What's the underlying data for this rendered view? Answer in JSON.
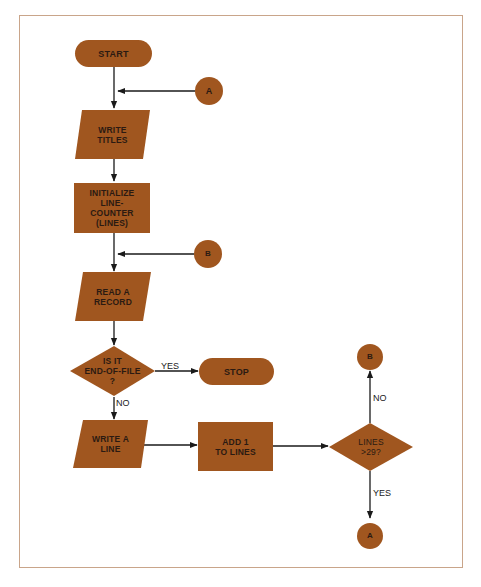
{
  "colors": {
    "shape_fill": "#a0561f",
    "line": "#1a1a1a",
    "frame_border": "#c9a58a",
    "text": "#2b1a12"
  },
  "nodes": {
    "start": {
      "label": "START",
      "shape": "terminal"
    },
    "connector_a_top": {
      "label": "A",
      "shape": "connector"
    },
    "write_titles": {
      "label": "WRITE\nTITLES",
      "shape": "input-output"
    },
    "initialize": {
      "label": "INITIALIZE\nLINE-\nCOUNTER\n(LINES)",
      "shape": "process"
    },
    "connector_b_mid": {
      "label": "B",
      "shape": "connector"
    },
    "read_record": {
      "label": "READ A\nRECORD",
      "shape": "input-output"
    },
    "eof_decision": {
      "label": "IS IT\nEND-OF-FILE\n?",
      "shape": "decision"
    },
    "stop": {
      "label": "STOP",
      "shape": "terminal"
    },
    "write_line": {
      "label": "WRITE A\nLINE",
      "shape": "input-output"
    },
    "add_one": {
      "label": "ADD 1\nTO LINES",
      "shape": "process"
    },
    "lines_decision": {
      "label": "LINES\n>29?",
      "shape": "decision"
    },
    "connector_b_end": {
      "label": "B",
      "shape": "connector"
    },
    "connector_a_end": {
      "label": "A",
      "shape": "connector"
    }
  },
  "edges": {
    "eof_yes": "YES",
    "eof_no": "NO",
    "lines_no": "NO",
    "lines_yes": "YES"
  }
}
